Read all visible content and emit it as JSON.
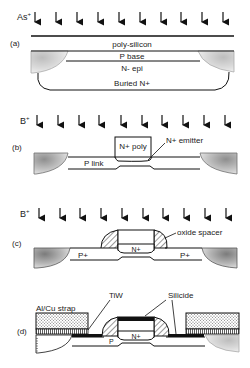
{
  "figure": {
    "panels": [
      {
        "id": "a",
        "label": "(a)",
        "ion": "As",
        "ion_sup": "+",
        "layers": [
          "poly-silicon",
          "P base",
          "N- epi",
          "Buried N+"
        ]
      },
      {
        "id": "b",
        "label": "(b)",
        "ion": "B",
        "ion_sup": "+",
        "labels": {
          "poly": "N+ poly",
          "emitter": "N+ emitter",
          "link": "P link"
        }
      },
      {
        "id": "c",
        "label": "(c)",
        "ion": "B",
        "ion_sup": "+",
        "labels": {
          "spacer": "oxide spacer",
          "n": "N+",
          "p_left": "P+",
          "p_right": "P+"
        }
      },
      {
        "id": "d",
        "label": "(d)",
        "labels": {
          "strap": "Al/Cu strap",
          "tiw": "TiW",
          "silicide": "Silicide",
          "n": "N+",
          "p": "P"
        }
      }
    ]
  }
}
